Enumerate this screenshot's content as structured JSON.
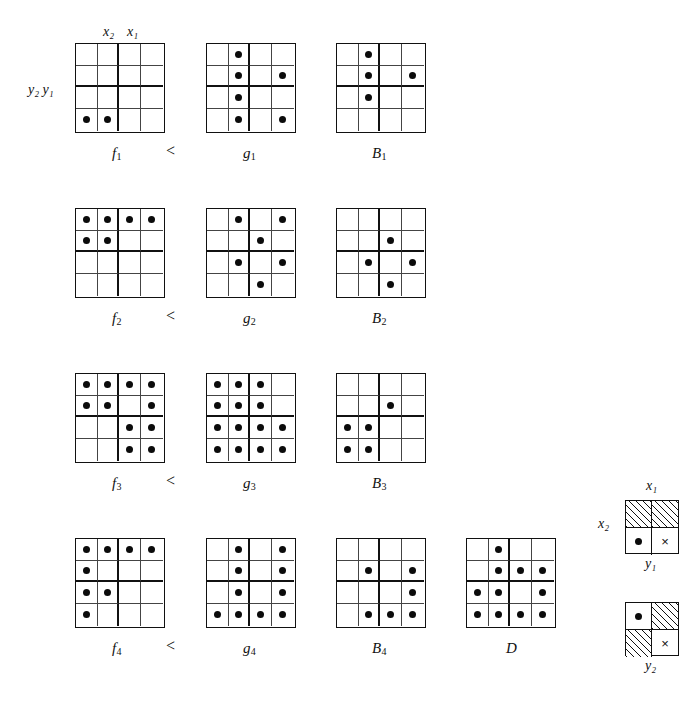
{
  "figure": {
    "relation_symbol": "<",
    "axis_top": {
      "x2": "x",
      "x2_sub": "2",
      "x1": "x",
      "x1_sub": "1"
    },
    "axis_left": {
      "y2": "y",
      "y2_sub": "2",
      "y1": "y",
      "y1_sub": "1"
    }
  },
  "labels": {
    "x2": "x₂",
    "x1": "x₁",
    "y2y1": "y₂ y₁",
    "less_than": "<"
  },
  "grids": [
    {
      "name": "f1",
      "label": "f",
      "sub": "1",
      "rows": 4,
      "cols": 4,
      "dots": [
        [
          4,
          1
        ],
        [
          4,
          2
        ]
      ]
    },
    {
      "name": "g1",
      "label": "g",
      "sub": "1",
      "rows": 4,
      "cols": 4,
      "dots": [
        [
          1,
          2
        ],
        [
          2,
          2
        ],
        [
          2,
          4
        ],
        [
          3,
          2
        ],
        [
          4,
          2
        ],
        [
          4,
          4
        ]
      ]
    },
    {
      "name": "B1",
      "label": "B",
      "sub": "1",
      "rows": 4,
      "cols": 4,
      "dots": [
        [
          1,
          2
        ],
        [
          2,
          2
        ],
        [
          2,
          4
        ],
        [
          3,
          2
        ]
      ]
    },
    {
      "name": "f2",
      "label": "f",
      "sub": "2",
      "rows": 4,
      "cols": 4,
      "dots": [
        [
          1,
          1
        ],
        [
          1,
          2
        ],
        [
          1,
          3
        ],
        [
          1,
          4
        ],
        [
          2,
          1
        ],
        [
          2,
          2
        ]
      ]
    },
    {
      "name": "g2",
      "label": "g",
      "sub": "2",
      "rows": 4,
      "cols": 4,
      "dots": [
        [
          1,
          2
        ],
        [
          1,
          4
        ],
        [
          2,
          3
        ],
        [
          3,
          2
        ],
        [
          3,
          4
        ],
        [
          4,
          3
        ]
      ]
    },
    {
      "name": "B2",
      "label": "B",
      "sub": "2",
      "rows": 4,
      "cols": 4,
      "dots": [
        [
          2,
          3
        ],
        [
          3,
          2
        ],
        [
          3,
          4
        ],
        [
          4,
          3
        ]
      ]
    },
    {
      "name": "f3",
      "label": "f",
      "sub": "3",
      "rows": 4,
      "cols": 4,
      "dots": [
        [
          1,
          1
        ],
        [
          1,
          2
        ],
        [
          1,
          3
        ],
        [
          1,
          4
        ],
        [
          2,
          1
        ],
        [
          2,
          2
        ],
        [
          2,
          4
        ],
        [
          3,
          3
        ],
        [
          3,
          4
        ],
        [
          4,
          3
        ],
        [
          4,
          4
        ]
      ]
    },
    {
      "name": "g3",
      "label": "g",
      "sub": "3",
      "rows": 4,
      "cols": 4,
      "dots": [
        [
          1,
          1
        ],
        [
          1,
          2
        ],
        [
          1,
          3
        ],
        [
          2,
          1
        ],
        [
          2,
          2
        ],
        [
          2,
          3
        ],
        [
          3,
          1
        ],
        [
          3,
          2
        ],
        [
          3,
          3
        ],
        [
          3,
          4
        ],
        [
          4,
          1
        ],
        [
          4,
          2
        ],
        [
          4,
          3
        ],
        [
          4,
          4
        ]
      ]
    },
    {
      "name": "B3",
      "label": "B",
      "sub": "3",
      "rows": 4,
      "cols": 4,
      "dots": [
        [
          2,
          3
        ],
        [
          3,
          1
        ],
        [
          3,
          2
        ],
        [
          4,
          1
        ],
        [
          4,
          2
        ]
      ]
    },
    {
      "name": "f4",
      "label": "f",
      "sub": "4",
      "rows": 4,
      "cols": 4,
      "dots": [
        [
          1,
          1
        ],
        [
          1,
          2
        ],
        [
          1,
          3
        ],
        [
          1,
          4
        ],
        [
          2,
          1
        ],
        [
          3,
          1
        ],
        [
          3,
          2
        ],
        [
          4,
          1
        ]
      ]
    },
    {
      "name": "g4",
      "label": "g",
      "sub": "4",
      "rows": 4,
      "cols": 4,
      "dots": [
        [
          1,
          2
        ],
        [
          1,
          4
        ],
        [
          2,
          2
        ],
        [
          2,
          4
        ],
        [
          3,
          2
        ],
        [
          3,
          4
        ],
        [
          4,
          1
        ],
        [
          4,
          2
        ],
        [
          4,
          3
        ],
        [
          4,
          4
        ]
      ]
    },
    {
      "name": "B4",
      "label": "B",
      "sub": "4",
      "rows": 4,
      "cols": 4,
      "dots": [
        [
          2,
          2
        ],
        [
          2,
          4
        ],
        [
          3,
          4
        ],
        [
          4,
          2
        ],
        [
          4,
          3
        ],
        [
          4,
          4
        ]
      ]
    },
    {
      "name": "D",
      "label": "D",
      "sub": "",
      "rows": 4,
      "cols": 4,
      "dots": [
        [
          1,
          2
        ],
        [
          2,
          2
        ],
        [
          2,
          3
        ],
        [
          2,
          4
        ],
        [
          3,
          1
        ],
        [
          3,
          2
        ],
        [
          3,
          4
        ],
        [
          4,
          1
        ],
        [
          4,
          2
        ],
        [
          4,
          3
        ],
        [
          4,
          4
        ]
      ]
    }
  ],
  "legends": [
    {
      "name": "legend-y1",
      "top_label": "x₁",
      "left_label": "x₂",
      "bottom_label": "y₁",
      "cells": [
        [
          "hatch",
          "hatch"
        ],
        [
          "dot",
          "cross"
        ]
      ]
    },
    {
      "name": "legend-y2",
      "top_label": "",
      "left_label": "",
      "bottom_label": "y₂",
      "cells": [
        [
          "dot",
          "hatch"
        ],
        [
          "hatch",
          "cross"
        ]
      ]
    }
  ],
  "layout": {
    "grid_size": 90,
    "positions": [
      {
        "name": "f1",
        "x": 75,
        "y": 43,
        "label_x": 112,
        "label_y": 145
      },
      {
        "name": "g1",
        "x": 206,
        "y": 43,
        "label_x": 243,
        "label_y": 145
      },
      {
        "name": "B1",
        "x": 336,
        "y": 43,
        "label_x": 372,
        "label_y": 145
      },
      {
        "name": "f2",
        "x": 75,
        "y": 208,
        "label_x": 112,
        "label_y": 310
      },
      {
        "name": "g2",
        "x": 206,
        "y": 208,
        "label_x": 243,
        "label_y": 310
      },
      {
        "name": "B2",
        "x": 336,
        "y": 208,
        "label_x": 372,
        "label_y": 310
      },
      {
        "name": "f3",
        "x": 75,
        "y": 373,
        "label_x": 112,
        "label_y": 475
      },
      {
        "name": "g3",
        "x": 206,
        "y": 373,
        "label_x": 243,
        "label_y": 475
      },
      {
        "name": "B3",
        "x": 336,
        "y": 373,
        "label_x": 372,
        "label_y": 475
      },
      {
        "name": "f4",
        "x": 75,
        "y": 538,
        "label_x": 112,
        "label_y": 640
      },
      {
        "name": "g4",
        "x": 206,
        "y": 538,
        "label_x": 243,
        "label_y": 640
      },
      {
        "name": "B4",
        "x": 336,
        "y": 538,
        "label_x": 372,
        "label_y": 640
      },
      {
        "name": "D",
        "x": 466,
        "y": 538,
        "label_x": 506,
        "label_y": 640
      }
    ],
    "relation_positions": [
      {
        "x": 166,
        "y": 142
      },
      {
        "x": 166,
        "y": 307
      },
      {
        "x": 166,
        "y": 472
      },
      {
        "x": 166,
        "y": 637
      }
    ]
  }
}
